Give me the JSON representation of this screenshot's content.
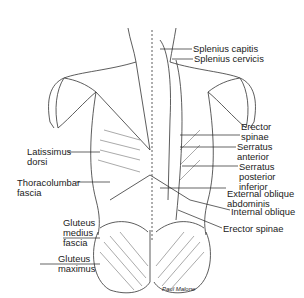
{
  "figure": {
    "signature": "Paul Malone",
    "labels_right": [
      {
        "id": "splenius-capitis",
        "lines": [
          "Splenius capitis"
        ]
      },
      {
        "id": "splenius-cervicis",
        "lines": [
          "Splenius cervicis"
        ]
      },
      {
        "id": "erector-spinae-upper",
        "lines": [
          "Erector",
          "spinae"
        ]
      },
      {
        "id": "serratus-anterior",
        "lines": [
          "Serratus",
          "anterior"
        ]
      },
      {
        "id": "serratus-posterior-inferior",
        "lines": [
          "Serratus",
          "posterior",
          "inferior"
        ]
      },
      {
        "id": "external-oblique",
        "lines": [
          "External oblique",
          "abdominis"
        ]
      },
      {
        "id": "internal-oblique",
        "lines": [
          "Internal oblique"
        ]
      },
      {
        "id": "erector-spinae-lower",
        "lines": [
          "Erector spinae"
        ]
      }
    ],
    "labels_left": [
      {
        "id": "latissimus-dorsi",
        "lines": [
          "Latissimus",
          "dorsi"
        ]
      },
      {
        "id": "thoracolumbar-fascia",
        "lines": [
          "Thoracolumbar",
          "fascia"
        ]
      },
      {
        "id": "gluteus-medius-fascia",
        "lines": [
          "Gluteus",
          "medius",
          "fascia"
        ]
      },
      {
        "id": "gluteus-maximus",
        "lines": [
          "Gluteus",
          "maximus"
        ]
      }
    ],
    "colors": {
      "ink": "#222222",
      "background": "#ffffff"
    }
  }
}
